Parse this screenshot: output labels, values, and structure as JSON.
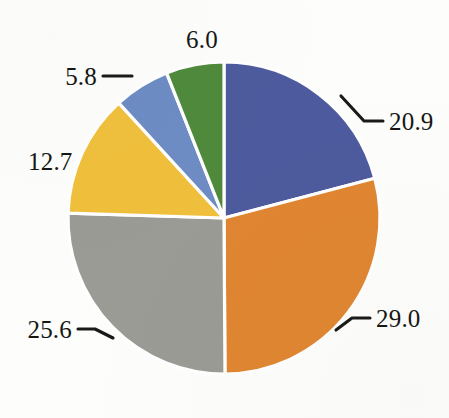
{
  "chart_data": {
    "type": "pie",
    "title": "",
    "subtitle": "",
    "xlabel": "",
    "ylabel": "",
    "legend_position": "none",
    "grid": false,
    "labels_shown": "values",
    "label_format": "one-decimal",
    "start_angle_deg": 0,
    "direction": "clockwise",
    "total": 100.0,
    "categories": [
      "20.9",
      "29.0",
      "25.6",
      "12.7",
      "5.8",
      "6.0"
    ],
    "values": [
      20.9,
      29.0,
      25.6,
      12.7,
      5.8,
      6.0
    ],
    "slices": [
      {
        "name": "slice-1",
        "value": 20.9,
        "label": "20.9",
        "color": "#4d5b9e",
        "color_name": "indigo-blue",
        "label_position": "right-upper",
        "has_leader_line": true
      },
      {
        "name": "slice-2",
        "value": 29.0,
        "label": "29.0",
        "color": "#e08632",
        "color_name": "orange",
        "label_position": "right-lower",
        "has_leader_line": true
      },
      {
        "name": "slice-3",
        "value": 25.6,
        "label": "25.6",
        "color": "#9b9b95",
        "color_name": "gray",
        "label_position": "left-lower",
        "has_leader_line": true
      },
      {
        "name": "slice-4",
        "value": 12.7,
        "label": "12.7",
        "color": "#f0c03c",
        "color_name": "gold-yellow",
        "label_position": "left-middle",
        "has_leader_line": false
      },
      {
        "name": "slice-5",
        "value": 5.8,
        "label": "5.8",
        "color": "#6e8cc4",
        "color_name": "light-blue",
        "label_position": "left-upper",
        "has_leader_line": true
      },
      {
        "name": "slice-6",
        "value": 6.0,
        "label": "6.0",
        "color": "#4f8a3c",
        "color_name": "green",
        "label_position": "top",
        "has_leader_line": false
      }
    ],
    "geometry": {
      "center_x": 224,
      "center_y": 218,
      "radius": 156,
      "separator_color": "#ffffff",
      "background_color": "#fdfdfb"
    }
  }
}
